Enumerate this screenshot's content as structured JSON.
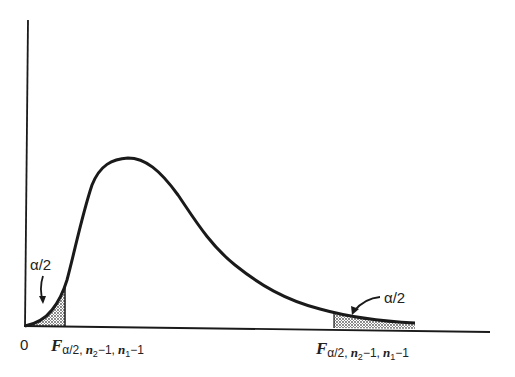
{
  "figure": {
    "type": "F-distribution density curve with two-tailed rejection regions",
    "origin_label": "0",
    "left_tail": {
      "area_label": "α/2",
      "critical_value": {
        "base": "F",
        "sub_alpha": "α/2,",
        "sub_n2": "n",
        "sub_n2_idx": "2",
        "sub_mid": "−1,",
        "sub_n1": "n",
        "sub_n1_idx": "1",
        "sub_end": "−1"
      }
    },
    "right_tail": {
      "area_label": "α/2",
      "critical_value": {
        "base": "F",
        "sub_alpha": "α/2,",
        "sub_n2": "n",
        "sub_n2_idx": "2",
        "sub_mid": "−1,",
        "sub_n1": "n",
        "sub_n1_idx": "1",
        "sub_end": "−1"
      }
    },
    "colors": {
      "ink": "#1a1a1a",
      "background": "#ffffff",
      "shading": "#888888"
    }
  }
}
